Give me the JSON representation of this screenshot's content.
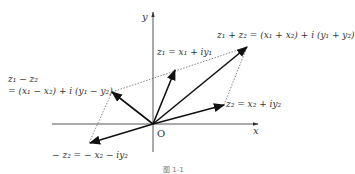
{
  "diagram": {
    "axes": {
      "x_label": "x",
      "y_label": "y",
      "origin_label": "O"
    },
    "vectors": [
      {
        "id": "z1",
        "label": "z₁ = x₁ + iy₁"
      },
      {
        "id": "z2",
        "label": "z₂ = x₂ + iy₂"
      },
      {
        "id": "sum",
        "label": "z₁ + z₂ = (x₁ + x₂) + i (y₁ + y₂)"
      },
      {
        "id": "diff",
        "label_line1": "z₁ − z₂",
        "label_line2": "= (x₁ − x₂) + i (y₁ − y₂)"
      },
      {
        "id": "neg_z2",
        "label": "− z₂ = − x₂ − iy₂"
      }
    ],
    "caption": "图 1-1",
    "colors": {
      "axis": "#444444",
      "vector": "#111111",
      "dotted": "#666666"
    }
  }
}
